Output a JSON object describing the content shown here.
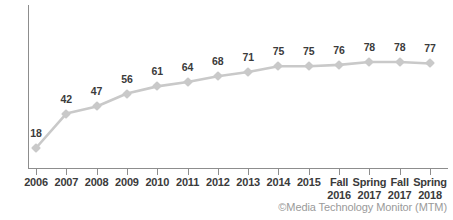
{
  "chart_data": {
    "type": "line",
    "title": "",
    "subtitle": "",
    "xlabel": "",
    "ylabel": "",
    "ylim": [
      0,
      100
    ],
    "grid": false,
    "legend": "none",
    "categories": [
      "2006",
      "2007",
      "2008",
      "2009",
      "2010",
      "2011",
      "2012",
      "2013",
      "2014",
      "2015",
      "Fall 2016",
      "Spring 2017",
      "Fall 2017",
      "Spring 2018"
    ],
    "tick_labels": [
      {
        "line1": "2006",
        "line2": ""
      },
      {
        "line1": "2007",
        "line2": ""
      },
      {
        "line1": "2008",
        "line2": ""
      },
      {
        "line1": "2009",
        "line2": ""
      },
      {
        "line1": "2010",
        "line2": ""
      },
      {
        "line1": "2011",
        "line2": ""
      },
      {
        "line1": "2012",
        "line2": ""
      },
      {
        "line1": "2013",
        "line2": ""
      },
      {
        "line1": "2014",
        "line2": ""
      },
      {
        "line1": "2015",
        "line2": ""
      },
      {
        "line1": "Fall",
        "line2": "2016"
      },
      {
        "line1": "Spring",
        "line2": "2017"
      },
      {
        "line1": "Fall",
        "line2": "2017"
      },
      {
        "line1": "Spring",
        "line2": "2018"
      }
    ],
    "values": [
      18,
      42,
      47,
      56,
      61,
      64,
      68,
      71,
      75,
      75,
      76,
      78,
      78,
      77
    ],
    "data_labels": [
      "18",
      "42",
      "47",
      "56",
      "61",
      "64",
      "68",
      "71",
      "75",
      "75",
      "76",
      "78",
      "78",
      "77"
    ],
    "series": [
      {
        "name": "",
        "values": [
          18,
          42,
          47,
          56,
          61,
          64,
          68,
          71,
          75,
          75,
          76,
          78,
          78,
          77
        ]
      }
    ]
  },
  "footer": {
    "copyright": "©Media Technology Monitor (MTM)"
  },
  "colors": {
    "line": "#c9c9c9",
    "marker": "#c9c9c9",
    "label_text": "#3b3b3b",
    "axis": "#8d8d8d",
    "copyright_text": "#9a9a9a",
    "background": "#ffffff"
  }
}
